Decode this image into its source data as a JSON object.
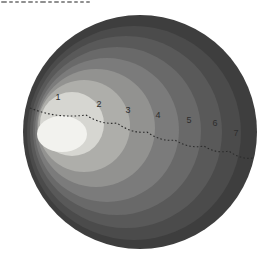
{
  "figure": {
    "title_semantic": "nested-brightness-zones-diagram",
    "background": "#ffffff",
    "dash_color": "#2b2b2b",
    "dashed_path": "M 30 108 Q 57 119 86 115 Q 101 125 117 123 Q 132 134 147 132 Q 161 142 175 140 Q 189 149 204 146 Q 216 154 229 151 Q 241 160 253 158",
    "circles": [
      {
        "name": "outer-disk",
        "cx": 140,
        "cy": 132,
        "r": 117,
        "fill": "#3e3e3e"
      },
      {
        "name": "zone-circle-7",
        "cx": 134,
        "cy": 133,
        "r": 107,
        "fill": "#4b4b4b"
      },
      {
        "name": "zone-circle-6",
        "cx": 126,
        "cy": 132,
        "r": 96,
        "fill": "#595959"
      },
      {
        "name": "zone-circle-5",
        "cx": 117,
        "cy": 131,
        "r": 84,
        "fill": "#696969"
      },
      {
        "name": "zone-circle-4",
        "cx": 107,
        "cy": 130,
        "r": 72,
        "fill": "#7b7b7b"
      },
      {
        "name": "zone-circle-3",
        "cx": 96,
        "cy": 128,
        "r": 59,
        "fill": "#929290"
      },
      {
        "name": "zone-circle-2",
        "cx": 84,
        "cy": 126,
        "r": 46,
        "fill": "#aeaeaa"
      },
      {
        "name": "zone-circle-1",
        "cx": 72,
        "cy": 124,
        "r": 32,
        "fill": "#d6d6d1"
      },
      {
        "name": "bright-core",
        "cx": 62,
        "cy": 134,
        "rx": 25,
        "ry": 18,
        "fill": "#f2f2ee"
      }
    ],
    "labels": [
      {
        "text": "1",
        "x": 58,
        "y": 100
      },
      {
        "text": "2",
        "x": 99,
        "y": 107
      },
      {
        "text": "3",
        "x": 128,
        "y": 113
      },
      {
        "text": "4",
        "x": 158,
        "y": 118
      },
      {
        "text": "5",
        "x": 189,
        "y": 123
      },
      {
        "text": "6",
        "x": 215,
        "y": 126
      },
      {
        "text": "7",
        "x": 236,
        "y": 136
      }
    ],
    "caption_marks": [
      {
        "x": 0,
        "w": 6
      },
      {
        "x": 8,
        "w": 4
      },
      {
        "x": 14,
        "w": 4
      },
      {
        "x": 20,
        "w": 5
      },
      {
        "x": 27,
        "w": 5
      },
      {
        "x": 34,
        "w": 3
      },
      {
        "x": 39,
        "w": 6
      },
      {
        "x": 47,
        "w": 4
      },
      {
        "x": 53,
        "w": 5
      },
      {
        "x": 60,
        "w": 4
      },
      {
        "x": 66,
        "w": 5
      },
      {
        "x": 73,
        "w": 4
      },
      {
        "x": 79,
        "w": 4
      },
      {
        "x": 85,
        "w": 4
      }
    ]
  }
}
